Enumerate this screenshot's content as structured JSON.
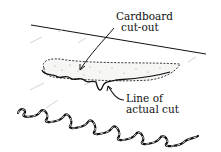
{
  "diagram": {
    "labels": {
      "cardboard_line1": "Cardboard",
      "cardboard_line2": "cut-out",
      "cut_line1": "Line of",
      "cut_line2": "actual cut"
    },
    "colors": {
      "ink": "#111111",
      "faint_ink": "#bbbbbb",
      "background": "#ffffff"
    }
  }
}
